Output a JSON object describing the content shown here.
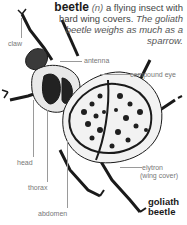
{
  "entry": {
    "word": "beetle",
    "part_of_speech": "(n)",
    "definition": "a flying insect with hard wing covers.",
    "example": "The goliath beetle weighs as much as a sparrow."
  },
  "labels": {
    "claw": "claw",
    "antenna": "antenna",
    "compound_eye": "compound eye",
    "head": "head",
    "thorax": "thorax",
    "abdomen": "abdomen",
    "elytron": "elytron",
    "elytron_note": "(wing cover)"
  },
  "illustration_title": {
    "line1": "goliath",
    "line2": "beetle"
  }
}
